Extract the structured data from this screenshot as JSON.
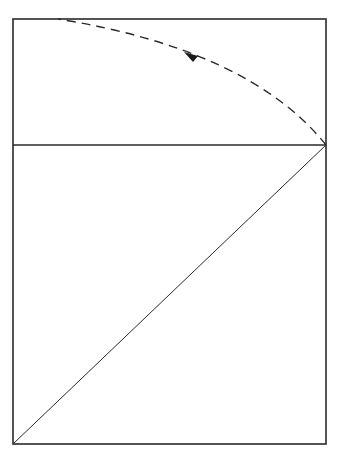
{
  "diagram": {
    "stroke_color": "#2a2a2a",
    "background": "#ffffff",
    "rectangle": {
      "x": 13,
      "y": 19,
      "width": 313,
      "height": 425
    },
    "divider": {
      "x1": 13,
      "y1": 145,
      "x2": 326,
      "y2": 145
    },
    "diagonal": {
      "x1": 13,
      "y1": 444,
      "x2": 326,
      "y2": 145
    },
    "arc": {
      "from": [
        326,
        145
      ],
      "to": [
        58,
        19
      ],
      "style": "dashed",
      "arrow_at": [
        190,
        56
      ],
      "arrow_direction": "counter-clockwise"
    }
  }
}
